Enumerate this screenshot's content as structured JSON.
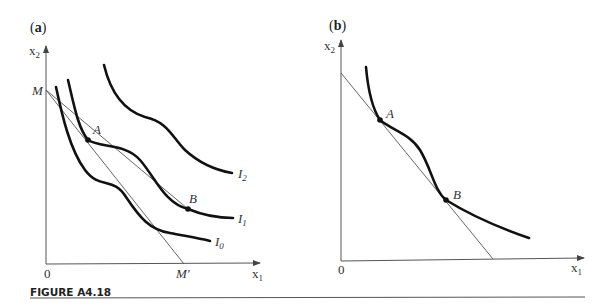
{
  "figure": {
    "caption": "FIGURE A4.18",
    "panels": [
      {
        "id": "a",
        "label_open": "(",
        "label_letter": "a",
        "label_close": ")",
        "y_axis_label": "x",
        "y_axis_sub": "2",
        "x_axis_label": "x",
        "x_axis_sub": "1",
        "origin_label": "0",
        "intercept_y_label": "M",
        "intercept_x_label": "M′",
        "points": [
          {
            "label": "A"
          },
          {
            "label": "B"
          }
        ],
        "curves": [
          {
            "label": "I",
            "sub": "0"
          },
          {
            "label": "I",
            "sub": "1"
          },
          {
            "label": "I",
            "sub": "2"
          }
        ]
      },
      {
        "id": "b",
        "label_open": "(",
        "label_letter": "b",
        "label_close": ")",
        "y_axis_label": "x",
        "y_axis_sub": "2",
        "x_axis_label": "x",
        "x_axis_sub": "1",
        "origin_label": "0",
        "points": [
          {
            "label": "A"
          },
          {
            "label": "B"
          }
        ]
      }
    ]
  },
  "colors": {
    "curve": "#111111",
    "axis": "#555555",
    "text": "#333333"
  }
}
